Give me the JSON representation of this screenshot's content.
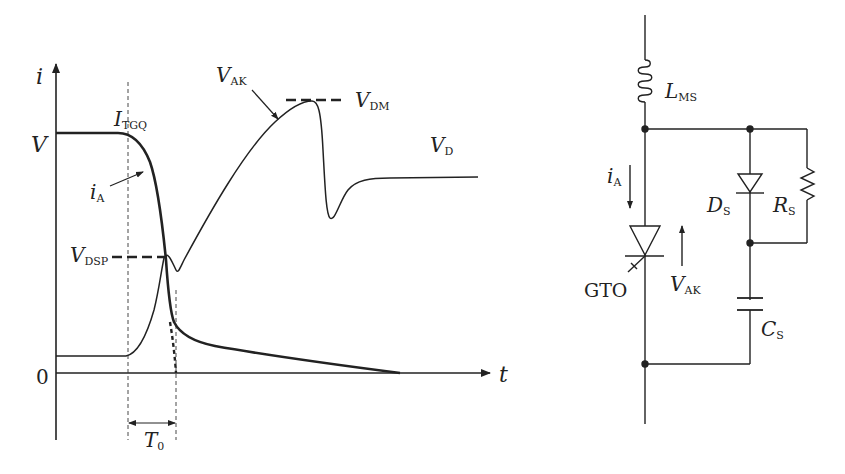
{
  "waveform": {
    "axes": {
      "y_label": "i",
      "x_label": "t",
      "origin_label": "0",
      "level_label": "V"
    },
    "curves": {
      "current": {
        "main": "i",
        "sub": "A"
      },
      "voltage": {
        "main": "V",
        "sub": "AK"
      }
    },
    "annotations": {
      "itgq": {
        "main": "I",
        "sub": "TGQ"
      },
      "vdm": {
        "main": "V",
        "sub": "DM"
      },
      "vd": {
        "main": "V",
        "sub": "D"
      },
      "vdsp": {
        "main": "V",
        "sub": "DSP"
      },
      "t0": {
        "main": "T",
        "sub": "0"
      }
    }
  },
  "circuit": {
    "inductor": {
      "main": "L",
      "sub": "MS"
    },
    "current_arrow": {
      "main": "i",
      "sub": "A"
    },
    "device": "GTO",
    "voltage_arrow": {
      "main": "V",
      "sub": "AK"
    },
    "diode": {
      "main": "D",
      "sub": "S"
    },
    "resistor": {
      "main": "R",
      "sub": "S"
    },
    "capacitor": {
      "main": "C",
      "sub": "S"
    }
  },
  "colors": {
    "ink": "#222222",
    "background": "#ffffff"
  }
}
